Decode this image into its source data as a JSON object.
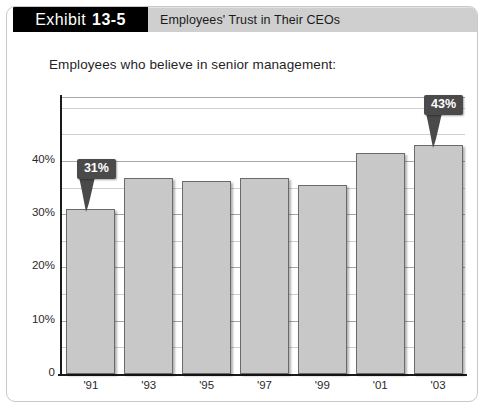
{
  "header": {
    "exhibit_label": "Exhibit",
    "exhibit_number": "13-5",
    "title": "Employees' Trust in Their CEOs"
  },
  "subtitle": "Employees who believe in senior management:",
  "colors": {
    "exhibit_box_bg": "#000000",
    "title_bar_bg": "#cfcfcf",
    "bar_fill": "#c8c8c8",
    "bar_stroke": "#6a6a6a",
    "callout_bg": "#4a4a4a",
    "callout_text": "#ffffff",
    "axis": "#1a1a1a",
    "gridline_major": "#a7a7a7",
    "gridline_minor": "#cfcfcf",
    "panel_border": "#c9c9c9"
  },
  "chart_data": {
    "type": "bar",
    "title": "Employees' Trust in Their CEOs",
    "subtitle": "Employees who believe in senior management:",
    "xlabel": "",
    "ylabel": "",
    "categories": [
      "'91",
      "'93",
      "'95",
      "'97",
      "'99",
      "'01",
      "'03"
    ],
    "values": [
      31,
      36.8,
      36.3,
      36.8,
      35.5,
      41.5,
      43
    ],
    "ylim": [
      0,
      52
    ],
    "ytick_values": [
      0,
      10,
      20,
      30,
      40
    ],
    "ytick_labels": [
      "0",
      "10%",
      "20%",
      "30%",
      "40%"
    ],
    "minor_tick_values": [
      5,
      15,
      25,
      35,
      45,
      50
    ],
    "grid": true,
    "legend": false,
    "annotations": [
      {
        "label": "31%",
        "category": "'91",
        "value": 31
      },
      {
        "label": "43%",
        "category": "'03",
        "value": 43
      }
    ]
  }
}
